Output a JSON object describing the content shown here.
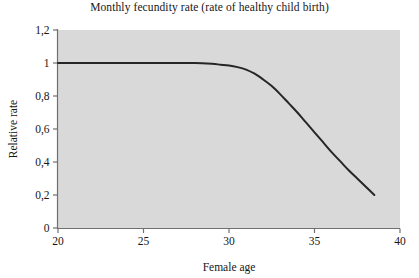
{
  "chart_data": {
    "type": "line",
    "title": "Monthly fecundity rate (rate of healthy child birth)",
    "xlabel": "Female age",
    "ylabel": "Relative rate",
    "xlim": [
      20,
      40
    ],
    "ylim": [
      0,
      1.2
    ],
    "grid": false,
    "legend": "none",
    "plot_background_color": "#d9d9d9",
    "line_color": "#262626",
    "axis_color": "#707070",
    "x_ticks": [
      20,
      25,
      30,
      35,
      40
    ],
    "x_tick_labels": [
      "20",
      "25",
      "30",
      "35",
      "40"
    ],
    "y_ticks": [
      0,
      0.2,
      0.4,
      0.6,
      0.8,
      1,
      1.2
    ],
    "y_tick_labels": [
      "0",
      "0,2",
      "0,4",
      "0,6",
      "0,8",
      "1",
      "1,2"
    ],
    "series": [
      {
        "name": "Relative fecundity rate",
        "x": [
          20.0,
          21.0,
          22.0,
          23.0,
          24.0,
          25.0,
          26.0,
          27.0,
          28.0,
          29.0,
          29.5,
          30.0,
          30.5,
          31.0,
          31.5,
          32.0,
          32.5,
          33.0,
          33.5,
          34.0,
          34.5,
          35.0,
          35.5,
          36.0,
          36.5,
          37.0,
          37.5,
          38.0,
          38.5
        ],
        "y": [
          1.0,
          1.0,
          1.0,
          1.0,
          1.0,
          1.0,
          1.0,
          1.0,
          1.0,
          0.995,
          0.99,
          0.985,
          0.975,
          0.96,
          0.935,
          0.9,
          0.86,
          0.81,
          0.755,
          0.7,
          0.64,
          0.58,
          0.52,
          0.46,
          0.405,
          0.35,
          0.3,
          0.25,
          0.2
        ]
      }
    ]
  }
}
